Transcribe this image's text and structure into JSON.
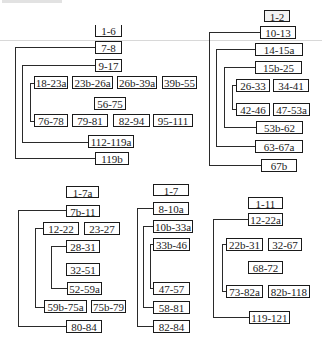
{
  "diagrams": [
    {
      "name": "structure-a",
      "nodes": [
        "1-6",
        "7-8",
        "9-17",
        "18-23a",
        "23b-26a",
        "26b-39a",
        "39b-55",
        "56-75",
        "76-78",
        "79-81",
        "82-94",
        "95-111",
        "112-119a",
        "119b"
      ]
    },
    {
      "name": "structure-b",
      "nodes": [
        "1-2",
        "10-13",
        "14-15a",
        "15b-25",
        "26-33",
        "34-41",
        "42-46",
        "47-53a",
        "53b-62",
        "63-67a",
        "67b"
      ]
    },
    {
      "name": "structure-c",
      "nodes": [
        "1-7a",
        "7b-11",
        "12-22",
        "23-27",
        "28-31",
        "32-51",
        "52-59a",
        "59b-75a",
        "75b-79",
        "80-84"
      ]
    },
    {
      "name": "structure-d",
      "nodes": [
        "1-7",
        "8-10a",
        "10b-33a",
        "33b-46",
        "47-57",
        "58-81",
        "82-84"
      ]
    },
    {
      "name": "structure-e",
      "nodes": [
        "1-11",
        "12-22a",
        "22b-31",
        "32-67",
        "68-72",
        "73-82a",
        "82b-118",
        "119-121"
      ]
    }
  ],
  "colors": {
    "line": "#2a2a2a",
    "box_border": "#1a1a1a",
    "background": "#ffffff"
  }
}
